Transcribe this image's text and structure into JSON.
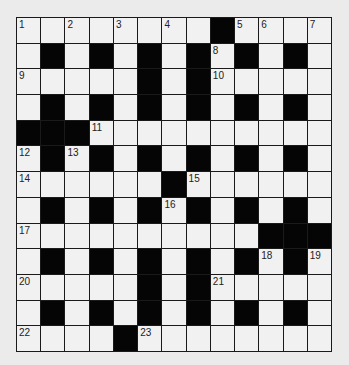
{
  "puzzle": {
    "type": "crossword",
    "rows": 13,
    "cols": 13,
    "grid": [
      "....._..#....",
      ".#.#.#.#.#.#.",
      "....#.#....._",
      ".#.#.#.#.#.#.",
      "###..........",
      ".#.#.#.#.#.#.",
      "......#......",
      ".#.#.#.#.#.#.",
      "..........###",
      ".#.#.#.#.#.#.",
      ".....#.#.....",
      ".#.#.#.#.#.#.",
      "....#........"
    ],
    "cells": [
      [
        "1",
        "",
        "2",
        "",
        "3",
        "",
        "4",
        "",
        "#",
        "5",
        "6",
        "",
        "7"
      ],
      [
        "",
        "#",
        "",
        "#",
        "",
        "#",
        "",
        "#",
        "8",
        "#",
        "",
        "#",
        ""
      ],
      [
        "9",
        "",
        "",
        "",
        "",
        "#",
        "",
        "#",
        "10",
        "",
        "",
        "",
        ""
      ],
      [
        "",
        "#",
        "",
        "#",
        "",
        "#",
        "",
        "#",
        "",
        "#",
        "",
        "#",
        ""
      ],
      [
        "#",
        "#",
        "#",
        "11",
        "",
        "",
        "",
        "",
        "",
        "",
        "",
        "",
        ""
      ],
      [
        "12",
        "#",
        "13",
        "#",
        "",
        "#",
        "",
        "#",
        "",
        "#",
        "",
        "#",
        ""
      ],
      [
        "14",
        "",
        "",
        "",
        "",
        "",
        "#",
        "15",
        "",
        "",
        "",
        "",
        ""
      ],
      [
        "",
        "#",
        "",
        "#",
        "",
        "#",
        "16",
        "#",
        "",
        "#",
        "",
        "#",
        ""
      ],
      [
        "17",
        "",
        "",
        "",
        "",
        "",
        "",
        "",
        "",
        "",
        "#",
        "#",
        "#"
      ],
      [
        "",
        "#",
        "",
        "#",
        "",
        "#",
        "",
        "#",
        "",
        "#",
        "18",
        "#",
        "19"
      ],
      [
        "20",
        "",
        "",
        "",
        "",
        "#",
        "",
        "#",
        "21",
        "",
        "",
        "",
        ""
      ],
      [
        "",
        "#",
        "",
        "#",
        "",
        "#",
        "",
        "#",
        "",
        "#",
        "",
        "#",
        ""
      ],
      [
        "22",
        "",
        "",
        "",
        "#",
        "23",
        "",
        "",
        "",
        "",
        "",
        "",
        ""
      ]
    ],
    "clue_numbers": [
      "1",
      "2",
      "3",
      "4",
      "5",
      "6",
      "7",
      "8",
      "9",
      "10",
      "11",
      "12",
      "13",
      "14",
      "15",
      "16",
      "17",
      "18",
      "19",
      "20",
      "21",
      "22",
      "23"
    ]
  }
}
